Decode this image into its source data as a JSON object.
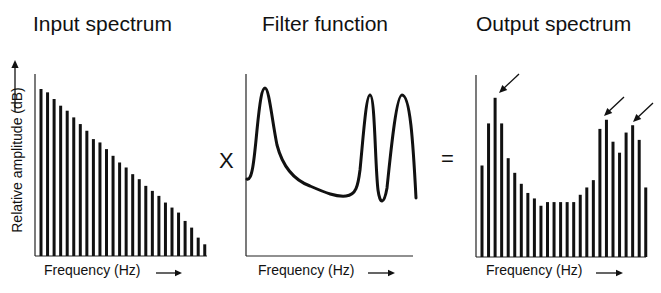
{
  "panels": [
    {
      "title": "Input spectrum",
      "xlabel": "Frequency (Hz)"
    },
    {
      "title": "Filter function",
      "xlabel": "Frequency (Hz)"
    },
    {
      "title": "Output spectrum",
      "xlabel": "Frequency (Hz)"
    }
  ],
  "ylabel": "Relative amplitude (dB)",
  "operators": {
    "multiply": "X",
    "equals": "="
  },
  "chart_data": [
    {
      "type": "bar",
      "title": "Input spectrum",
      "xlabel": "Frequency (Hz)",
      "ylabel": "Relative amplitude (dB)",
      "values": [
        100,
        98,
        94,
        90,
        87,
        83,
        79,
        75,
        70,
        68,
        64,
        60,
        56,
        53,
        49,
        46,
        42,
        39,
        36,
        32,
        29,
        26,
        21,
        17,
        11,
        7
      ]
    },
    {
      "type": "line",
      "title": "Filter function",
      "xlabel": "Frequency (Hz)",
      "description": "Filter response with three resonant peaks: one at low frequency, two at high frequency",
      "peaks": [
        "low",
        "high-1",
        "high-2"
      ]
    },
    {
      "type": "bar",
      "title": "Output spectrum",
      "xlabel": "Frequency (Hz)",
      "values": [
        50,
        73,
        87,
        73,
        54,
        46,
        40,
        35,
        32,
        28,
        30,
        30,
        30,
        30,
        30,
        34,
        38,
        42,
        70,
        75,
        63,
        57,
        68,
        72,
        64,
        38
      ],
      "annotations": [
        "arrow at peak 1",
        "arrow at peak 2",
        "arrow at peak 3"
      ]
    }
  ]
}
